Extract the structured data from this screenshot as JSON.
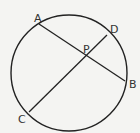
{
  "diagram": {
    "type": "circle-intersecting-chords",
    "background": "#f4f4f2",
    "stroke_color": "#222222",
    "circle": {
      "cx": 69,
      "cy": 73,
      "r": 58
    },
    "points": {
      "A": {
        "label": "A",
        "x": 39,
        "y": 24,
        "lx": 34,
        "ly": 22
      },
      "B": {
        "label": "B",
        "x": 125,
        "y": 81,
        "lx": 129,
        "ly": 88
      },
      "C": {
        "label": "C",
        "x": 29,
        "y": 112,
        "lx": 18,
        "ly": 123
      },
      "D": {
        "label": "D",
        "x": 107,
        "y": 35,
        "lx": 110,
        "ly": 33
      },
      "P": {
        "label": "P",
        "x": 86,
        "y": 56,
        "lx": 83,
        "ly": 53
      }
    },
    "chords": [
      {
        "name": "AB",
        "from": "A",
        "to": "B"
      },
      {
        "name": "CD",
        "from": "C",
        "to": "D"
      }
    ]
  }
}
